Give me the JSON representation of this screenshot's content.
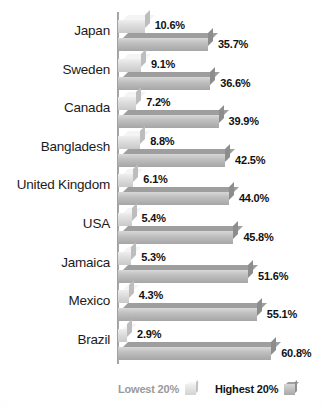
{
  "chart_data": {
    "type": "bar",
    "orientation": "horizontal",
    "title": "",
    "subtitle": "",
    "xlabel": "",
    "ylabel": "",
    "grid": false,
    "legend_position": "bottom",
    "categories": [
      "Japan",
      "Sweden",
      "Canada",
      "Bangladesh",
      "United Kingdom",
      "USA",
      "Jamaica",
      "Mexico",
      "Brazil"
    ],
    "series": [
      {
        "name": "Lowest 20%",
        "color": "#dcdcdc",
        "values": [
          10.6,
          9.1,
          7.2,
          8.8,
          6.1,
          5.4,
          5.3,
          4.3,
          2.9
        ],
        "labels": [
          "10.6%",
          "9.1%",
          "7.2%",
          "8.8%",
          "6.1%",
          "5.4%",
          "5.3%",
          "4.3%",
          "2.9%"
        ]
      },
      {
        "name": "Highest 20%",
        "color": "#b4b4b4",
        "values": [
          35.7,
          36.6,
          39.9,
          42.5,
          44.0,
          45.8,
          51.6,
          55.1,
          60.8
        ],
        "labels": [
          "35.7%",
          "36.6%",
          "39.9%",
          "42.5%",
          "44.0%",
          "45.8%",
          "51.6%",
          "55.1%",
          "60.8%"
        ]
      }
    ],
    "xlim": [
      0,
      65
    ],
    "value_unit": "%"
  },
  "legend": {
    "items": [
      {
        "label": "Lowest 20%",
        "swatch": "light-gray-cube"
      },
      {
        "label": "Highest 20%",
        "swatch": "dark-gray-cube"
      }
    ]
  }
}
